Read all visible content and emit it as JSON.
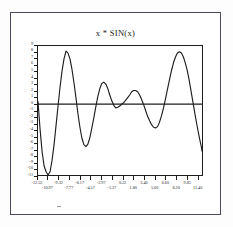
{
  "figure": {
    "title": "x * SIN(x)"
  },
  "chart_data": {
    "type": "line",
    "title": "x * SIN(x)",
    "xlabel": "",
    "ylabel": "",
    "xlim": [
      -12.52,
      12.2
    ],
    "ylim": [
      -11.0,
      9.0
    ],
    "grid": false,
    "legend": "none",
    "zero_line": true,
    "x_tick_labels": [
      "-12.52",
      "-10.97",
      "-9.32",
      "-7.77",
      "-6.17",
      "-4.57",
      "-2.97",
      "-1.37",
      "0.22",
      "1.80",
      "3.40",
      "5.00",
      "6.60",
      "8.20",
      "9.85",
      "11.40"
    ],
    "x_tick_values": [
      -12.52,
      -10.97,
      -9.32,
      -7.77,
      -6.17,
      -4.57,
      -2.97,
      -1.37,
      0.22,
      1.8,
      3.4,
      5.0,
      6.6,
      8.2,
      9.85,
      11.4
    ],
    "y_tick_labels": [
      "9",
      "8",
      "7",
      "6",
      "5",
      "4",
      "3",
      "2",
      "1",
      "0",
      "-1",
      "-2",
      "-3",
      "-4",
      "-5",
      "-6",
      "-7",
      "-8",
      "-9",
      "-10",
      "-11"
    ],
    "y_tick_values": [
      9,
      8,
      7,
      6,
      5,
      4,
      3,
      2,
      1,
      0,
      -1,
      -2,
      -3,
      -4,
      -5,
      -6,
      -7,
      -8,
      -9,
      -10,
      -11
    ],
    "series": [
      {
        "name": "x * SIN(x)",
        "color": "#1d1d1d",
        "x": [
          -12.52,
          -12.2,
          -11.9,
          -11.6,
          -11.3,
          -11.0,
          -10.7,
          -10.4,
          -10.1,
          -9.8,
          -9.5,
          -9.2,
          -8.9,
          -8.6,
          -8.3,
          -8.0,
          -7.7,
          -7.4,
          -7.1,
          -6.8,
          -6.5,
          -6.2,
          -5.9,
          -5.6,
          -5.3,
          -5.0,
          -4.7,
          -4.4,
          -4.1,
          -3.8,
          -3.5,
          -3.2,
          -2.9,
          -2.6,
          -2.3,
          -2.0,
          -1.7,
          -1.4,
          -1.1,
          -0.8,
          -0.5,
          -0.2,
          0.1,
          0.4,
          0.7,
          1.0,
          1.3,
          1.6,
          1.9,
          2.2,
          2.5,
          2.8,
          3.1,
          3.4,
          3.7,
          4.0,
          4.3,
          4.6,
          4.9,
          5.2,
          5.5,
          5.8,
          6.1,
          6.4,
          6.7,
          7.0,
          7.3,
          7.6,
          7.9,
          8.2,
          8.5,
          8.8,
          9.1,
          9.4,
          9.7,
          10.0,
          10.3,
          10.6,
          10.9,
          11.2,
          11.5,
          11.8,
          12.1,
          12.2
        ],
        "y": [
          0.4,
          -4.0,
          -7.4,
          -9.6,
          -10.5,
          -11.0,
          -10.5,
          -8.7,
          -6.3,
          -3.3,
          -0.3,
          2.6,
          5.1,
          7.0,
          8.2,
          7.9,
          7.0,
          5.4,
          3.3,
          1.0,
          -1.5,
          -3.6,
          -5.3,
          -6.3,
          -6.6,
          -6.2,
          -5.2,
          -3.7,
          -2.1,
          -0.4,
          1.2,
          2.4,
          3.2,
          3.4,
          3.1,
          2.4,
          1.4,
          0.5,
          -0.2,
          -0.6,
          -0.5,
          -0.3,
          0.0,
          0.2,
          0.6,
          1.0,
          1.4,
          1.9,
          2.1,
          2.1,
          1.9,
          1.4,
          0.7,
          -0.1,
          -1.0,
          -1.9,
          -2.6,
          -3.2,
          -3.6,
          -3.7,
          -3.5,
          -2.8,
          -1.8,
          -0.6,
          0.8,
          2.3,
          3.8,
          5.2,
          6.4,
          7.3,
          7.9,
          8.1,
          7.9,
          7.3,
          6.3,
          5.1,
          3.5,
          1.7,
          -0.1,
          -1.9,
          -3.6,
          -5.2,
          -6.6,
          -7.3
        ]
      }
    ]
  }
}
